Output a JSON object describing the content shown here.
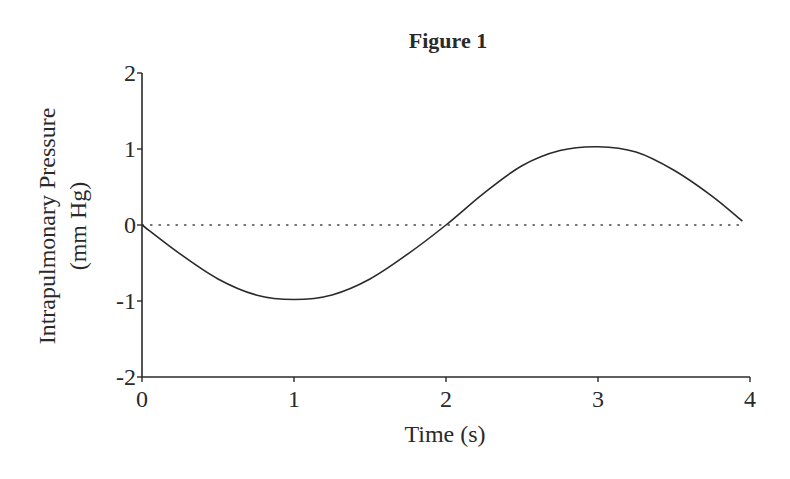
{
  "chart_data": {
    "type": "line",
    "title": "Figure 1",
    "xlabel": "Time (s)",
    "ylabel": [
      "Intrapulmonary Pressure",
      "(mm Hg)"
    ],
    "xlim": [
      0,
      4
    ],
    "ylim": [
      -2,
      2
    ],
    "xticks": [
      0,
      1,
      2,
      3,
      4
    ],
    "yticks": [
      -2,
      -1,
      0,
      1,
      2
    ],
    "xtick_labels": [
      "0",
      "1",
      "2",
      "3",
      "4"
    ],
    "ytick_labels": [
      "-2",
      "-1",
      "0",
      "1",
      "2"
    ],
    "grid": false,
    "legend": null,
    "reference_line": {
      "y": 0,
      "style": "dotted"
    },
    "series": [
      {
        "name": "Intrapulmonary Pressure",
        "color": "#2a2a2a",
        "x": [
          0,
          0.25,
          0.5,
          0.75,
          1.0,
          1.25,
          1.5,
          1.75,
          2.0,
          2.25,
          2.5,
          2.75,
          3.0,
          3.25,
          3.5,
          3.75,
          3.95
        ],
        "y": [
          0,
          -0.38,
          -0.71,
          -0.92,
          -0.98,
          -0.92,
          -0.71,
          -0.38,
          0,
          0.42,
          0.78,
          0.98,
          1.03,
          0.96,
          0.72,
          0.38,
          0.05
        ]
      }
    ]
  }
}
